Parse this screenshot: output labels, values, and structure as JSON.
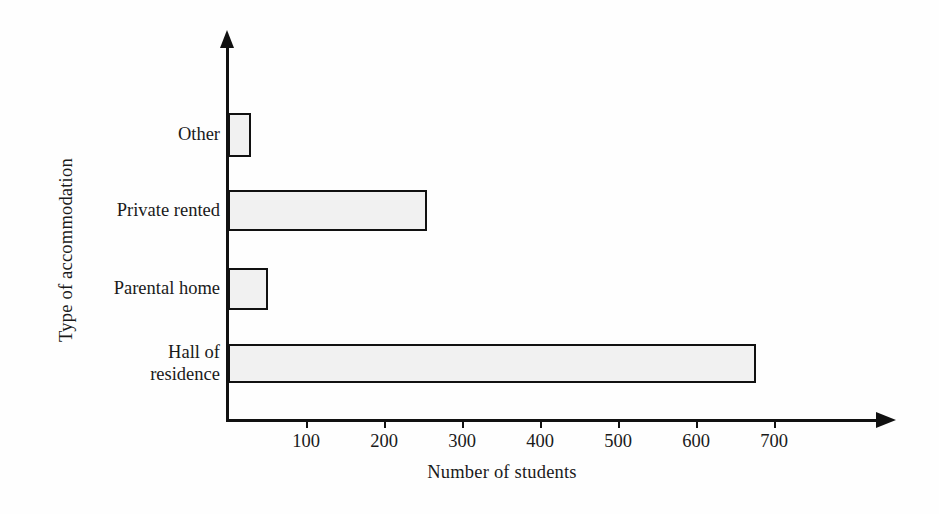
{
  "chart_data": {
    "type": "bar",
    "orientation": "horizontal",
    "title": "",
    "xlabel": "Number of students",
    "ylabel": "Type of accommodation",
    "categories": [
      "Hall of\nresidence",
      "Parental home",
      "Private rented",
      "Other"
    ],
    "values": [
      677,
      51,
      255,
      29
    ],
    "xlim": [
      0,
      840
    ],
    "xticks": [
      100,
      200,
      300,
      400,
      500,
      600,
      700
    ],
    "xtick_labels": [
      "100",
      "200",
      "300",
      "400",
      "500",
      "600",
      "700"
    ],
    "grid": false,
    "legend": null,
    "bar_fill_color": "#f1f1f1",
    "bar_edge_color": "#111111",
    "axis_color": "#111111",
    "background_color": "#fefefe"
  },
  "axes": {
    "y_title": "Type of accommodation",
    "x_title": "Number of students"
  },
  "bars": [
    {
      "label": "Other",
      "label_lines": "Other",
      "value": 29
    },
    {
      "label": "Private rented",
      "label_lines": "Private rented",
      "value": 255
    },
    {
      "label": "Parental home",
      "label_lines": "Parental home",
      "value": 51
    },
    {
      "label": "Hall of residence",
      "label_lines": "Hall of\nresidence",
      "value": 677
    }
  ],
  "ticks": [
    {
      "value": 100,
      "label": "100"
    },
    {
      "value": 200,
      "label": "200"
    },
    {
      "value": 300,
      "label": "300"
    },
    {
      "value": 400,
      "label": "400"
    },
    {
      "value": 500,
      "label": "500"
    },
    {
      "value": 600,
      "label": "600"
    },
    {
      "value": 700,
      "label": "700"
    }
  ]
}
